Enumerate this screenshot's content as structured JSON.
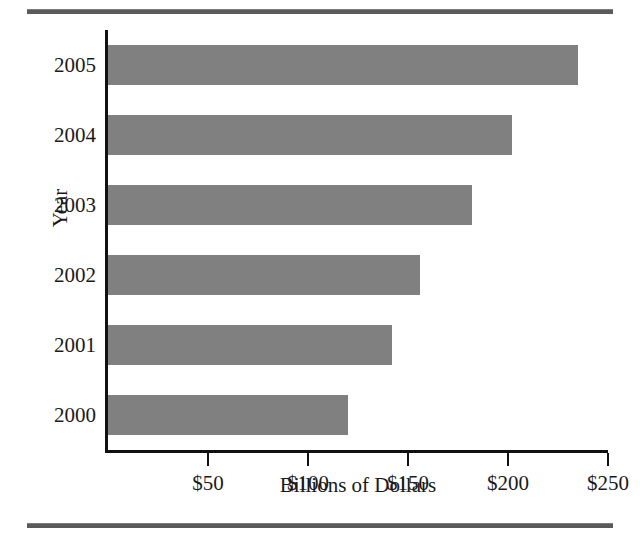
{
  "chart_data": {
    "type": "bar",
    "orientation": "horizontal",
    "title": "",
    "xlabel": "Billions of Dollars",
    "ylabel": "Year",
    "categories": [
      "2005",
      "2004",
      "2003",
      "2002",
      "2001",
      "2000"
    ],
    "values": [
      235,
      202,
      182,
      156,
      142,
      120
    ],
    "xlim": [
      0,
      250
    ],
    "xticks": [
      50,
      100,
      150,
      200,
      250
    ],
    "xtick_labels": [
      "$50",
      "$100",
      "$150",
      "$200",
      "$250"
    ],
    "grid": false,
    "legend": null,
    "bar_color": "#808080",
    "axis_color": "#111111",
    "rule_color": "#5a5a5a",
    "series": [
      {
        "name": "Billions of Dollars",
        "values": [
          235,
          202,
          182,
          156,
          142,
          120
        ]
      }
    ]
  }
}
